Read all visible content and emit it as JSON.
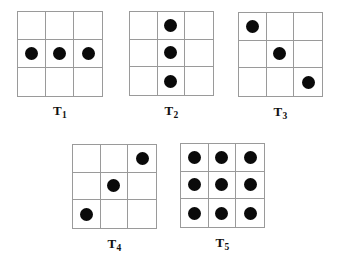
{
  "figure": {
    "width": 337,
    "height": 271,
    "background_color": "#ffffff",
    "grid_line_color": "#9a9a9a",
    "dot_color": "#0a0a0a",
    "dot_diameter_px": 13,
    "grid_size_px": 86,
    "rows": 3,
    "columns": 3
  },
  "chart_data": {
    "type": "heatmap",
    "title": "",
    "xlabel": "",
    "ylabel": "",
    "legend": [],
    "grid": true,
    "categories": [
      "T1",
      "T2",
      "T3",
      "T4",
      "T5"
    ],
    "values": [
      [
        [
          0,
          0,
          0
        ],
        [
          1,
          1,
          1
        ],
        [
          0,
          0,
          0
        ]
      ],
      [
        [
          0,
          1,
          0
        ],
        [
          0,
          1,
          0
        ],
        [
          0,
          1,
          0
        ]
      ],
      [
        [
          1,
          0,
          0
        ],
        [
          0,
          1,
          0
        ],
        [
          0,
          0,
          1
        ]
      ],
      [
        [
          0,
          0,
          1
        ],
        [
          0,
          1,
          0
        ],
        [
          1,
          0,
          0
        ]
      ],
      [
        [
          1,
          1,
          1
        ],
        [
          1,
          1,
          1
        ],
        [
          1,
          1,
          1
        ]
      ]
    ],
    "dot_counts": [
      3,
      3,
      3,
      3,
      9
    ]
  },
  "patterns": [
    {
      "id": "T1",
      "label_base": "T",
      "label_sub": "1",
      "x": 17,
      "y": 11,
      "size": 86,
      "label_y_offset": 92,
      "cells": [
        [
          0,
          0,
          0
        ],
        [
          1,
          1,
          1
        ],
        [
          0,
          0,
          0
        ]
      ],
      "dot_count": 3
    },
    {
      "id": "T2",
      "label_base": "T",
      "label_sub": "2",
      "x": 129,
      "y": 11,
      "size": 85,
      "label_y_offset": 92,
      "cells": [
        [
          0,
          1,
          0
        ],
        [
          0,
          1,
          0
        ],
        [
          0,
          1,
          0
        ]
      ],
      "dot_count": 3
    },
    {
      "id": "T3",
      "label_base": "T",
      "label_sub": "3",
      "x": 238,
      "y": 12,
      "size": 85,
      "label_y_offset": 92,
      "cells": [
        [
          1,
          0,
          0
        ],
        [
          0,
          1,
          0
        ],
        [
          0,
          0,
          1
        ]
      ],
      "dot_count": 3
    },
    {
      "id": "T4",
      "label_base": "T",
      "label_sub": "4",
      "x": 72,
      "y": 144,
      "size": 85,
      "label_y_offset": 92,
      "cells": [
        [
          0,
          0,
          1
        ],
        [
          0,
          1,
          0
        ],
        [
          1,
          0,
          0
        ]
      ],
      "dot_count": 3
    },
    {
      "id": "T5",
      "label_base": "T",
      "label_sub": "5",
      "x": 180,
      "y": 143,
      "size": 85,
      "label_y_offset": 92,
      "cells": [
        [
          1,
          1,
          1
        ],
        [
          1,
          1,
          1
        ],
        [
          1,
          1,
          1
        ]
      ],
      "dot_count": 9
    }
  ]
}
